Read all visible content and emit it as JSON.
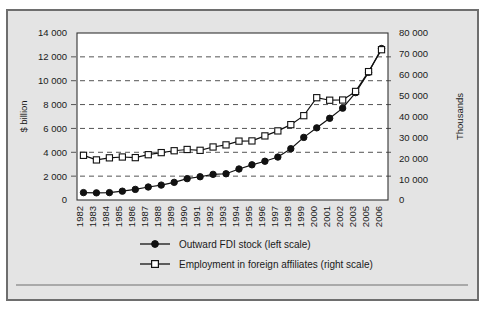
{
  "chart_data": {
    "type": "line",
    "title": "",
    "subtitle": "",
    "xlabel": "",
    "ylabel": "$ billion",
    "y2label": "Thousands",
    "grid": true,
    "legend_position": "bottom",
    "categories": [
      "1982",
      "1983",
      "1984",
      "1985",
      "1986",
      "1987",
      "1988",
      "1989",
      "1990",
      "1991",
      "1992",
      "1993",
      "1994",
      "1995",
      "1996",
      "1997",
      "1998",
      "1999",
      "2000",
      "2001",
      "2002",
      "2003",
      "2005",
      "2006"
    ],
    "ylim": [
      0,
      14000
    ],
    "yticks": [
      "0",
      "2 000",
      "4 000",
      "6 000",
      "8 000",
      "10 000",
      "12 000",
      "14 000"
    ],
    "ytick_values": [
      0,
      2000,
      4000,
      6000,
      8000,
      10000,
      12000,
      14000
    ],
    "y2lim": [
      0,
      80000
    ],
    "y2ticks": [
      "0",
      "10 000",
      "20 000",
      "30 000",
      "40 000",
      "50 000",
      "60 000",
      "70 000",
      "80 000"
    ],
    "y2tick_values": [
      0,
      10000,
      20000,
      30000,
      40000,
      50000,
      60000,
      70000,
      80000
    ],
    "series": [
      {
        "name": "Outward FDI stock (left scale)",
        "axis": "left",
        "marker": "filled-circle",
        "color": "#111111",
        "values": [
          620,
          600,
          620,
          740,
          890,
          1090,
          1250,
          1480,
          1790,
          1950,
          2150,
          2200,
          2600,
          2950,
          3250,
          3600,
          4300,
          5250,
          6050,
          6850,
          7700,
          9000,
          10700,
          12700
        ]
      },
      {
        "name": "Employment in foreign affiliates (right scale)",
        "axis": "right",
        "marker": "open-square",
        "color": "#111111",
        "values": [
          21400,
          19200,
          20200,
          20600,
          20300,
          21700,
          22700,
          23600,
          24200,
          23800,
          25400,
          26400,
          28200,
          28300,
          30700,
          33100,
          36100,
          40400,
          49000,
          47800,
          47900,
          52000,
          61500,
          72000
        ]
      }
    ]
  },
  "legend": {
    "items": [
      {
        "label": "Outward FDI stock (left scale)",
        "marker": "filled-circle"
      },
      {
        "label": "Employment in foreign affiliates (right scale)",
        "marker": "open-square"
      }
    ]
  },
  "axes": {
    "left_title": "$ billion",
    "right_title": "Thousands"
  }
}
